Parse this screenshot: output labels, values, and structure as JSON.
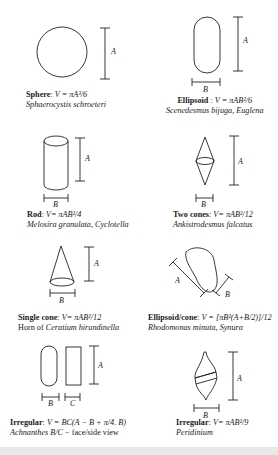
{
  "figure": {
    "panels": [
      {
        "id": "sphere",
        "name": "Sphere",
        "formula": "V = πA³/6",
        "organisms": "Sphaerocystis schroeteri",
        "dims": [
          "A"
        ]
      },
      {
        "id": "ellipsoid",
        "name": "Ellipsoid",
        "formula": "V = πAB²/6",
        "organisms": "Scenedesmus bijuga, Euglena",
        "dims": [
          "A",
          "B"
        ]
      },
      {
        "id": "rod",
        "name": "Rod",
        "formula": "V= πAB²/4",
        "organisms": "Melosira granulata, Cyclotella",
        "dims": [
          "A",
          "B"
        ]
      },
      {
        "id": "two-cones",
        "name": "Two cones",
        "formula": "V= πAB²/12",
        "organisms": "Ankistrodesmus falcatus",
        "dims": [
          "A",
          "B"
        ]
      },
      {
        "id": "single-cone",
        "name": "Single cone",
        "formula": "V= πAB²/12",
        "organisms_prefix": "Horn of ",
        "organisms": "Ceratium hirundinella",
        "dims": [
          "A",
          "B"
        ]
      },
      {
        "id": "ellipsoid-cone",
        "name": "Ellipsoid/cone",
        "formula": "V = [πB²(A+B/2)]/12",
        "organisms": "Rhodomonas minuta, Synura",
        "dims": [
          "A",
          "B"
        ]
      },
      {
        "id": "irregular-achnanthes",
        "name": "Irregular",
        "formula": "V = BC(A − B + π/4. B)",
        "organisms": "Achnanthes B/C",
        "organisms_suffix": " − face/side view",
        "dims": [
          "A",
          "B",
          "C"
        ]
      },
      {
        "id": "irregular-peridinium",
        "name": "Irregular",
        "formula": "V= πAB²/9",
        "organisms": "Peridinium",
        "dims": [
          "A",
          "B"
        ]
      }
    ],
    "labels": {
      "A": "A",
      "B": "B",
      "C": "C"
    }
  }
}
